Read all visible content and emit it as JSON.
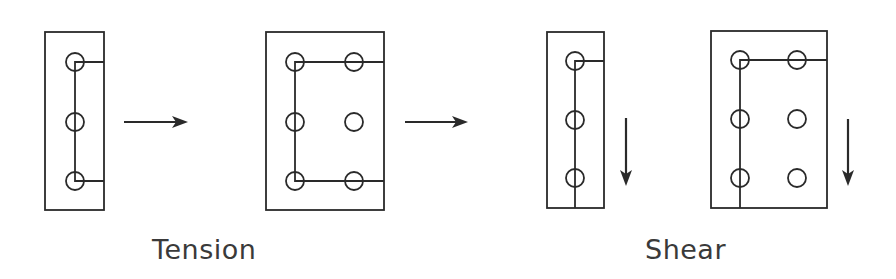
{
  "diagram": {
    "colors": {
      "line": "#2a2a2a",
      "text": "#3a3a3a",
      "background": "#ffffff"
    },
    "captions": {
      "tension": "Tension",
      "shear": "Shear"
    },
    "panels": [
      {
        "id": "tension-single-column",
        "group": "tension",
        "rect": {
          "x": 45,
          "y": 32,
          "w": 59,
          "h": 178
        },
        "bolts": [
          [
            75,
            62
          ],
          [
            75,
            122
          ],
          [
            75,
            181
          ]
        ],
        "connector": "bracket-top-bottom-to-right-edge"
      },
      {
        "id": "tension-double-column",
        "group": "tension",
        "rect": {
          "x": 266,
          "y": 32,
          "w": 118,
          "h": 178
        },
        "bolts": [
          [
            295,
            62
          ],
          [
            354,
            62
          ],
          [
            295,
            122
          ],
          [
            354,
            122
          ],
          [
            295,
            181
          ],
          [
            354,
            181
          ]
        ],
        "connector": "bracket-top-bottom-to-right-edge"
      },
      {
        "id": "shear-single-column",
        "group": "shear",
        "rect": {
          "x": 547,
          "y": 32,
          "w": 57,
          "h": 176
        },
        "bolts": [
          [
            575,
            61
          ],
          [
            575,
            120
          ],
          [
            575,
            178
          ]
        ],
        "connector": "top-to-right-edge-and-vertical-to-bottom"
      },
      {
        "id": "shear-double-column",
        "group": "shear",
        "rect": {
          "x": 711,
          "y": 31,
          "w": 116,
          "h": 177
        },
        "bolts": [
          [
            740,
            60
          ],
          [
            797,
            60
          ],
          [
            740,
            119
          ],
          [
            797,
            119
          ],
          [
            740,
            178
          ],
          [
            797,
            178
          ]
        ],
        "connector": "top-to-right-edge-and-vertical-to-bottom"
      }
    ],
    "arrows": [
      {
        "id": "arrow-right-1",
        "direction": "right",
        "x1": 124,
        "y1": 122,
        "x2": 188,
        "y2": 122
      },
      {
        "id": "arrow-right-2",
        "direction": "right",
        "x1": 405,
        "y1": 122,
        "x2": 468,
        "y2": 122
      },
      {
        "id": "arrow-down-1",
        "direction": "down",
        "x1": 626,
        "y1": 118,
        "x2": 626,
        "y2": 186
      },
      {
        "id": "arrow-down-2",
        "direction": "down",
        "x1": 848,
        "y1": 119,
        "x2": 848,
        "y2": 186
      }
    ],
    "bolt_radius": 9
  }
}
